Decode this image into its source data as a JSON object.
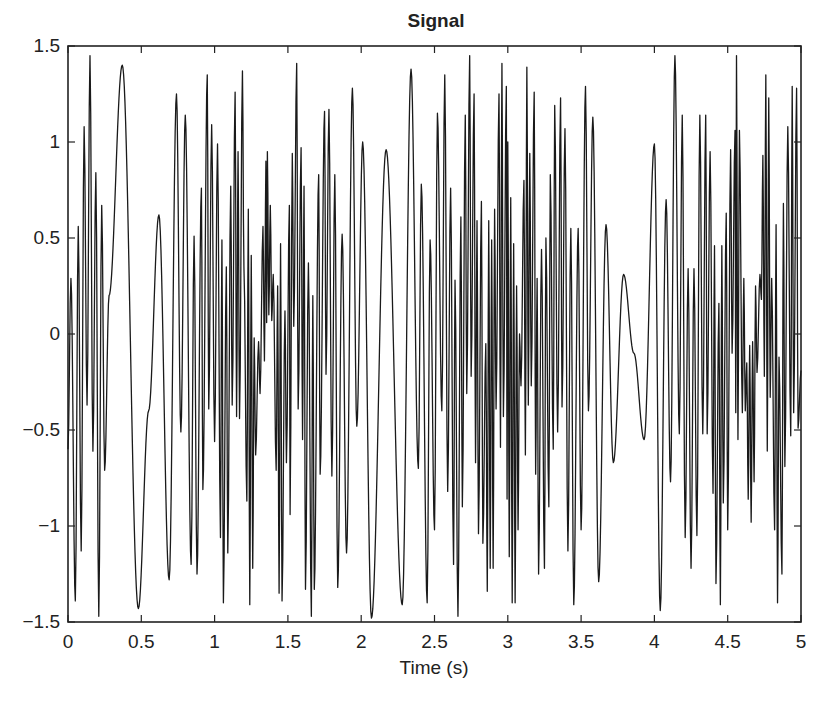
{
  "chart_data": {
    "type": "line",
    "title": "Signal",
    "xlabel": "Time (s)",
    "ylabel": "",
    "xlim": [
      0,
      5
    ],
    "ylim": [
      -1.5,
      1.5
    ],
    "grid": false,
    "legend": null,
    "xticks": [
      0,
      0.5,
      1,
      1.5,
      2,
      2.5,
      3,
      3.5,
      4,
      4.5,
      5
    ],
    "xtick_labels": [
      "0",
      "0.5",
      "1",
      "1.5",
      "2",
      "2.5",
      "3",
      "3.5",
      "4",
      "4.5",
      "5"
    ],
    "yticks": [
      1.5,
      1,
      0.5,
      0,
      -0.5,
      -1,
      -1.5
    ],
    "ytick_labels": [
      "1.5",
      "1",
      "0.5",
      "0",
      "−0.5",
      "−1",
      "−1.5"
    ],
    "line_color": "#1a1a1a",
    "series": [
      {
        "name": "Signal",
        "note": "Approximate local extrema traced from the plotted waveform (time s, amplitude)",
        "x": [
          0.0,
          0.02,
          0.05,
          0.07,
          0.09,
          0.11,
          0.13,
          0.15,
          0.17,
          0.19,
          0.21,
          0.23,
          0.25,
          0.28,
          0.37,
          0.48,
          0.55,
          0.62,
          0.69,
          0.74,
          0.77,
          0.8,
          0.84,
          0.86,
          0.88,
          0.91,
          0.92,
          0.95,
          0.96,
          0.98,
          1.0,
          1.02,
          1.04,
          1.05,
          1.06,
          1.08,
          1.09,
          1.11,
          1.12,
          1.14,
          1.15,
          1.16,
          1.17,
          1.19,
          1.2,
          1.22,
          1.23,
          1.24,
          1.25,
          1.26,
          1.27,
          1.28,
          1.3,
          1.31,
          1.33,
          1.34,
          1.35,
          1.355,
          1.36,
          1.37,
          1.38,
          1.39,
          1.4,
          1.42,
          1.43,
          1.44,
          1.45,
          1.46,
          1.48,
          1.49,
          1.51,
          1.515,
          1.53,
          1.54,
          1.56,
          1.57,
          1.59,
          1.6,
          1.61,
          1.62,
          1.64,
          1.66,
          1.67,
          1.68,
          1.71,
          1.72,
          1.75,
          1.76,
          1.78,
          1.8,
          1.82,
          1.84,
          1.87,
          1.9,
          1.94,
          1.97,
          2.01,
          2.07,
          2.17,
          2.28,
          2.34,
          2.39,
          2.41,
          2.45,
          2.47,
          2.5,
          2.52,
          2.55,
          2.57,
          2.59,
          2.61,
          2.63,
          2.64,
          2.66,
          2.68,
          2.69,
          2.71,
          2.72,
          2.74,
          2.75,
          2.77,
          2.78,
          2.79,
          2.8,
          2.82,
          2.83,
          2.85,
          2.86,
          2.87,
          2.88,
          2.89,
          2.9,
          2.91,
          2.92,
          2.94,
          2.95,
          2.96,
          2.97,
          2.99,
          2.995,
          3.0,
          3.01,
          3.02,
          3.03,
          3.04,
          3.05,
          3.06,
          3.07,
          3.08,
          3.09,
          3.11,
          3.12,
          3.13,
          3.14,
          3.15,
          3.16,
          3.18,
          3.19,
          3.2,
          3.21,
          3.23,
          3.25,
          3.26,
          3.28,
          3.29,
          3.31,
          3.32,
          3.34,
          3.36,
          3.37,
          3.39,
          3.41,
          3.43,
          3.45,
          3.48,
          3.5,
          3.53,
          3.55,
          3.58,
          3.62,
          3.67,
          3.72,
          3.79,
          3.86,
          3.93,
          4.0,
          4.04,
          4.08,
          4.11,
          4.14,
          4.17,
          4.19,
          4.21,
          4.23,
          4.25,
          4.27,
          4.29,
          4.31,
          4.33,
          4.35,
          4.36,
          4.38,
          4.4,
          4.41,
          4.42,
          4.44,
          4.45,
          4.46,
          4.47,
          4.49,
          4.5,
          4.52,
          4.53,
          4.55,
          4.555,
          4.56,
          4.57,
          4.58,
          4.6,
          4.61,
          4.62,
          4.63,
          4.64,
          4.65,
          4.66,
          4.67,
          4.68,
          4.69,
          4.7,
          4.72,
          4.73,
          4.74,
          4.75,
          4.76,
          4.77,
          4.78,
          4.79,
          4.8,
          4.82,
          4.83,
          4.84,
          4.85,
          4.87,
          4.88,
          4.89,
          4.91,
          4.93,
          4.94,
          4.95,
          4.97,
          4.98,
          5.0
        ],
        "y": [
          -0.6,
          0.29,
          -1.39,
          0.56,
          -1.13,
          1.08,
          -0.37,
          1.45,
          -0.61,
          0.84,
          -1.47,
          0.67,
          -0.71,
          0.2,
          1.4,
          -1.43,
          -0.4,
          0.62,
          -1.28,
          1.25,
          -0.51,
          1.14,
          -1.2,
          0.51,
          -1.25,
          0.76,
          -0.81,
          1.35,
          -0.39,
          1.09,
          -0.56,
          0.99,
          -1.06,
          0.49,
          -1.4,
          0.35,
          -1.14,
          0.77,
          -0.37,
          1.26,
          -0.43,
          0.95,
          -0.44,
          1.37,
          0.35,
          -0.87,
          0.65,
          -1.41,
          0.41,
          -1.22,
          -0.02,
          -0.63,
          -0.04,
          -0.31,
          0.56,
          -0.14,
          0.9,
          0.06,
          0.95,
          0.1,
          0.67,
          0.07,
          0.31,
          -0.71,
          0.25,
          -1.35,
          0.47,
          -1.39,
          0.12,
          -0.67,
          0.67,
          -0.94,
          0.94,
          0.04,
          1.41,
          -0.39,
          0.97,
          -0.55,
          0.77,
          -1.33,
          0.37,
          -1.47,
          0.2,
          -1.33,
          0.83,
          -0.73,
          1.16,
          -0.21,
          1.17,
          -0.74,
          0.83,
          -1.32,
          0.52,
          -1.14,
          1.28,
          -0.48,
          1.0,
          -1.48,
          0.96,
          -1.41,
          1.38,
          -0.7,
          0.78,
          -1.4,
          0.49,
          -1.02,
          1.15,
          -0.4,
          1.35,
          -0.82,
          0.76,
          -1.2,
          0.28,
          -1.47,
          0.61,
          -0.9,
          1.14,
          -0.31,
          1.45,
          -0.22,
          1.25,
          -0.67,
          0.59,
          -1.04,
          0.69,
          -1.09,
          -0.05,
          -1.34,
          0.59,
          -1.22,
          0.49,
          -1.22,
          0.65,
          -0.39,
          1.25,
          -0.59,
          1.41,
          -0.43,
          1.29,
          -0.86,
          1.0,
          -1.16,
          0.71,
          -1.4,
          0.47,
          -1.4,
          0.25,
          -1.02,
          0.0,
          -0.27,
          0.8,
          -0.63,
          1.39,
          -0.37,
          0.94,
          -0.27,
          1.26,
          -0.73,
          0.29,
          -1.25,
          0.44,
          -1.22,
          0.5,
          -0.9,
          0.83,
          -0.6,
          1.19,
          -0.51,
          1.23,
          -0.38,
          1.07,
          -1.13,
          0.55,
          -1.41,
          0.55,
          -1.02,
          1.29,
          -0.4,
          1.13,
          -1.29,
          0.57,
          -0.67,
          0.31,
          -0.1,
          -0.55,
          0.99,
          -1.44,
          0.7,
          -0.77,
          1.45,
          -0.52,
          1.14,
          -1.06,
          0.34,
          -1.22,
          0.34,
          -1.05,
          1.14,
          -0.52,
          1.14,
          -0.52,
          0.95,
          -0.83,
          0.46,
          -1.3,
          0.16,
          -1.41,
          0.46,
          -0.88,
          0.63,
          -1.02,
          0.96,
          -0.1,
          1.06,
          -0.41,
          1.45,
          -0.55,
          1.06,
          -0.41,
          0.29,
          -0.4,
          -0.15,
          -0.86,
          -0.06,
          -0.98,
          -0.04,
          -0.77,
          0.25,
          -0.2,
          0.31,
          0.18,
          0.93,
          -0.22,
          1.35,
          -0.61,
          1.23,
          -0.33,
          0.29,
          -1.02,
          0.57,
          -1.4,
          -0.12,
          -1.25,
          0.68,
          -0.69,
          1.08,
          -0.53,
          1.29,
          -0.41,
          1.28,
          -0.49,
          -0.19
        ]
      }
    ]
  },
  "layout": {
    "plot_left": 68,
    "plot_top": 46,
    "plot_right": 801,
    "plot_bottom": 622
  }
}
